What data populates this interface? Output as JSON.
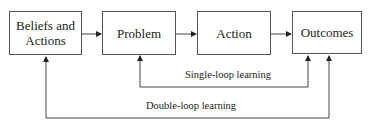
{
  "diagram": {
    "nodes": [
      {
        "id": "beliefs",
        "label": "Beliefs and Actions"
      },
      {
        "id": "problem",
        "label": "Problem"
      },
      {
        "id": "action",
        "label": "Action"
      },
      {
        "id": "outcomes",
        "label": "Outcomes"
      }
    ],
    "edges": [
      {
        "from": "beliefs",
        "to": "problem"
      },
      {
        "from": "problem",
        "to": "action"
      },
      {
        "from": "action",
        "to": "outcomes"
      },
      {
        "from": "outcomes",
        "to": "problem",
        "label": "Single-loop learning"
      },
      {
        "from": "outcomes",
        "to": "beliefs",
        "label": "Double-loop learning"
      }
    ],
    "loops": {
      "single": "Single-loop learning",
      "double": "Double-loop learning"
    }
  }
}
